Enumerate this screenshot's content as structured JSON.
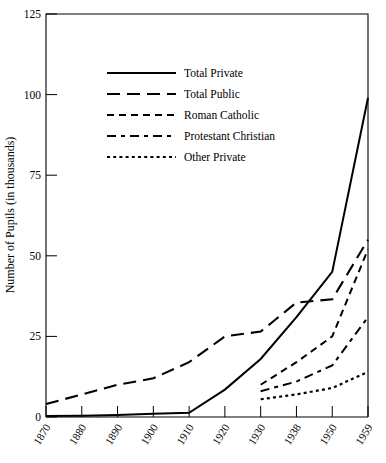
{
  "chart_data": {
    "type": "line",
    "title": "",
    "xlabel": "",
    "ylabel": "Number of Pupils (in thousands)",
    "xlim": [
      1870,
      1959
    ],
    "ylim": [
      0,
      125
    ],
    "yticks": [
      0,
      25,
      50,
      75,
      100,
      125
    ],
    "ytick_labels": [
      "0",
      "25",
      "50",
      "75",
      "100",
      "125"
    ],
    "x": [
      1870,
      1880,
      1890,
      1900,
      1910,
      1920,
      1930,
      1938,
      1950,
      1959
    ],
    "xtick_labels": [
      "1870",
      "1880",
      "1890",
      "1900",
      "1910",
      "1920",
      "1930",
      "1938",
      "1950",
      "1959"
    ],
    "grid": false,
    "legend_position": "upper-left-inside",
    "series": [
      {
        "name": "Total Private",
        "style": "solid",
        "x": [
          1870,
          1880,
          1890,
          1900,
          1910,
          1920,
          1930,
          1938,
          1950,
          1959
        ],
        "values": [
          0.3,
          0.4,
          0.6,
          1.0,
          1.3,
          8.5,
          18.0,
          31.0,
          45.0,
          99.0
        ]
      },
      {
        "name": "Total Public",
        "style": "long-dash",
        "x": [
          1870,
          1880,
          1890,
          1900,
          1910,
          1920,
          1930,
          1938,
          1950,
          1959
        ],
        "values": [
          4.0,
          7.0,
          10.0,
          12.0,
          17.0,
          25.0,
          26.5,
          35.5,
          36.5,
          55.0
        ]
      },
      {
        "name": "Roman Catholic",
        "style": "dash",
        "x": [
          1930,
          1938,
          1950,
          1959
        ],
        "values": [
          10.0,
          17.0,
          25.0,
          52.0
        ]
      },
      {
        "name": "Protestant Christian",
        "style": "dash-dot",
        "x": [
          1930,
          1938,
          1950,
          1959
        ],
        "values": [
          8.0,
          11.0,
          16.0,
          31.0
        ]
      },
      {
        "name": "Other Private",
        "style": "dotted",
        "x": [
          1930,
          1938,
          1950,
          1959
        ],
        "values": [
          5.5,
          7.0,
          9.0,
          14.0
        ]
      }
    ]
  },
  "legend": {
    "entries": [
      {
        "label": "Total Private",
        "key": "total-private"
      },
      {
        "label": "Total Public",
        "key": "total-public"
      },
      {
        "label": "Roman Catholic",
        "key": "roman-catholic"
      },
      {
        "label": "Protestant Christian",
        "key": "protestant-christian"
      },
      {
        "label": "Other Private",
        "key": "other-private"
      }
    ]
  },
  "colors": {
    "ink": "#000000",
    "background": "#ffffff"
  }
}
